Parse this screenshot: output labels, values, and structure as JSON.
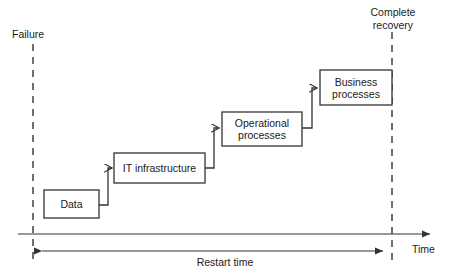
{
  "diagram": {
    "type": "step-recovery-timeline",
    "colors": {
      "stroke": "#333333",
      "box_fill": "#ffffff",
      "text": "#1a1a1a",
      "background": "#ffffff"
    },
    "markers": {
      "failure": {
        "label": "Failure",
        "x": 33,
        "line_style": "dashed"
      },
      "complete_recovery": {
        "label_line1": "Complete",
        "label_line2": "recovery",
        "x": 392,
        "line_style": "dashed"
      }
    },
    "axis": {
      "label": "Time",
      "y": 234,
      "arrow": "right"
    },
    "measure": {
      "label": "Restart time",
      "from_x": 33,
      "to_x": 392,
      "y": 251,
      "arrow": "double"
    },
    "steps": [
      {
        "id": "data",
        "label": "Data",
        "order": 1,
        "x": 44,
        "y": 190,
        "width": 55,
        "height": 28
      },
      {
        "id": "it-infrastructure",
        "label": "IT infrastructure",
        "order": 2,
        "x": 114,
        "y": 153,
        "width": 91,
        "height": 30
      },
      {
        "id": "operational-processes",
        "label_line1": "Operational",
        "label_line2": "processes",
        "order": 3,
        "x": 222,
        "y": 112,
        "width": 80,
        "height": 34
      },
      {
        "id": "business-processes",
        "label_line1": "Business",
        "label_line2": "processes",
        "order": 4,
        "x": 320,
        "y": 70,
        "width": 72,
        "height": 35
      }
    ],
    "connectors": [
      {
        "from": "data",
        "to": "it-infrastructure",
        "style": "elbow-up-right",
        "arrowhead": true
      },
      {
        "from": "it-infrastructure",
        "to": "operational-processes",
        "style": "elbow-up-right",
        "arrowhead": true
      },
      {
        "from": "operational-processes",
        "to": "business-processes",
        "style": "elbow-up-right",
        "arrowhead": true
      }
    ]
  }
}
